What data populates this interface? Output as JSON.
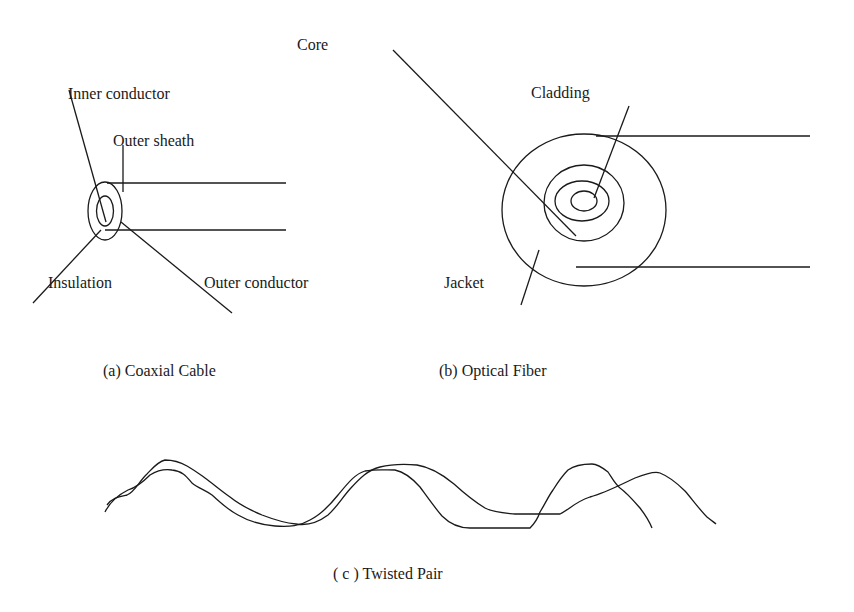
{
  "coax": {
    "labels": {
      "inner_conductor": "Inner conductor",
      "outer_sheath": "Outer sheath",
      "insulation": "Insulation",
      "outer_conductor": "Outer conductor"
    },
    "caption": "(a) Coaxial Cable"
  },
  "fiber": {
    "labels": {
      "core": "Core",
      "cladding": "Cladding",
      "jacket": "Jacket"
    },
    "caption": "(b) Optical Fiber"
  },
  "twisted_pair": {
    "caption": "( c )  Twisted Pair"
  },
  "colors": {
    "stroke": "#1a1a1a",
    "background": "#ffffff"
  }
}
